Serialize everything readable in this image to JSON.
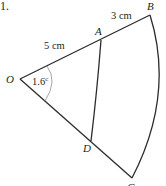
{
  "question_number": "1.",
  "points": {
    "O": "O",
    "A": "A",
    "B": "B",
    "C": "C",
    "D": "D"
  },
  "measurements": {
    "OA": "5 cm",
    "AB": "3 cm",
    "angle": "1.6",
    "angle_unit": "c"
  },
  "colors": {
    "line": "#2b2b2b",
    "angle_arc": "#9a9a9a",
    "text": "#231f20"
  }
}
